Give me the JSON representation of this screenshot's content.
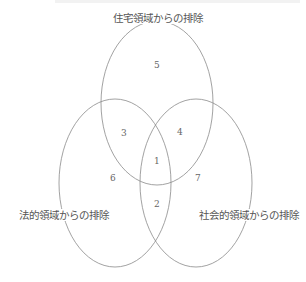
{
  "diagram": {
    "type": "venn-3",
    "sets": [
      {
        "id": "housing",
        "label": "住宅領域からの排除"
      },
      {
        "id": "legal",
        "label": "法的領域からの排除"
      },
      {
        "id": "social",
        "label": "社会的領域からの排除"
      }
    ],
    "regions": [
      {
        "number": "1",
        "sets": [
          "housing",
          "legal",
          "social"
        ]
      },
      {
        "number": "2",
        "sets": [
          "legal",
          "social"
        ]
      },
      {
        "number": "3",
        "sets": [
          "housing",
          "legal"
        ]
      },
      {
        "number": "4",
        "sets": [
          "housing",
          "social"
        ]
      },
      {
        "number": "5",
        "sets": [
          "housing"
        ]
      },
      {
        "number": "6",
        "sets": [
          "legal"
        ]
      },
      {
        "number": "7",
        "sets": [
          "social"
        ]
      }
    ],
    "stroke_color": "#8a8a8a"
  }
}
